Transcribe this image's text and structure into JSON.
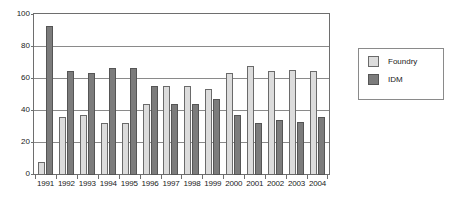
{
  "chart_data": {
    "type": "bar",
    "title": "",
    "subtitle": "",
    "xlabel": "",
    "ylabel": "",
    "ylim": [
      0,
      100
    ],
    "yticks": [
      0,
      20,
      40,
      60,
      80,
      100
    ],
    "grid": true,
    "legend_position": "right",
    "categories": [
      "1991",
      "1992",
      "1993",
      "1994",
      "1995",
      "1996",
      "1997",
      "1998",
      "1999",
      "2000",
      "2001",
      "2002",
      "2003",
      "2004"
    ],
    "series": [
      {
        "name": "Foundry",
        "color": "#dcdcdc",
        "values": [
          8,
          36,
          37,
          32,
          32,
          44,
          55,
          55,
          53,
          63,
          67,
          64,
          65,
          64
        ]
      },
      {
        "name": "IDM",
        "color": "#7c7c7c",
        "values": [
          92,
          64,
          63,
          66,
          66,
          55,
          44,
          44,
          47,
          37,
          32,
          34,
          33,
          36
        ]
      }
    ]
  },
  "legend": {
    "items": [
      {
        "label": "Foundry",
        "swatch": "foundry"
      },
      {
        "label": "IDM",
        "swatch": "idm"
      }
    ]
  }
}
